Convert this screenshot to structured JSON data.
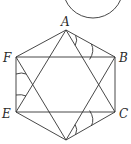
{
  "figure": {
    "type": "geometry-diagram",
    "vertices": [
      {
        "name": "A",
        "x": 66,
        "y": 30,
        "label": "A",
        "lx": 62,
        "ly": 25
      },
      {
        "name": "B",
        "x": 115,
        "y": 57,
        "label": "B",
        "lx": 119,
        "ly": 62
      },
      {
        "name": "C",
        "x": 115,
        "y": 112,
        "label": "C",
        "lx": 119,
        "ly": 118
      },
      {
        "name": "D",
        "x": 66,
        "y": 140,
        "label": "",
        "lx": 0,
        "ly": 0
      },
      {
        "name": "E",
        "x": 16,
        "y": 112,
        "label": "E",
        "lx": 2,
        "ly": 118
      },
      {
        "name": "F",
        "x": 16,
        "y": 57,
        "label": "F",
        "lx": 2,
        "ly": 62
      }
    ],
    "labels": {
      "A": "A",
      "B": "B",
      "C": "C",
      "E": "E",
      "F": "F"
    },
    "circle": {
      "cx": 93,
      "cy": -12,
      "r": 30
    },
    "segments": [
      [
        "A",
        "B"
      ],
      [
        "B",
        "C"
      ],
      [
        "C",
        "D"
      ],
      [
        "D",
        "E"
      ],
      [
        "E",
        "F"
      ],
      [
        "F",
        "A"
      ],
      [
        "A",
        "E"
      ],
      [
        "A",
        "C"
      ],
      [
        "D",
        "F"
      ],
      [
        "D",
        "B"
      ],
      [
        "F",
        "B"
      ],
      [
        "E",
        "C"
      ]
    ]
  }
}
